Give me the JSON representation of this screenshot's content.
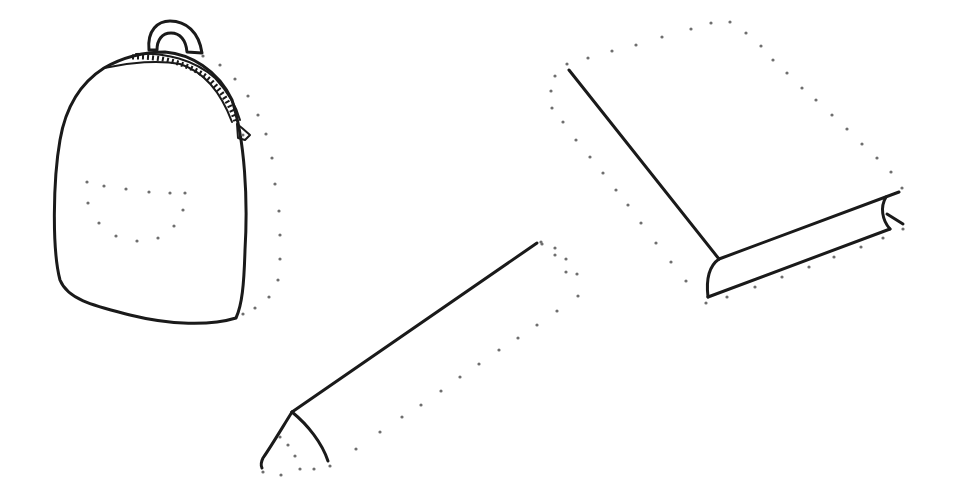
{
  "scene": {
    "description": "Complete-the-drawing worksheet: three partially drawn school objects with dotted guide lines",
    "background_color": "#ffffff",
    "ink_color": "#1a1a1a",
    "dot_color": "#6e6e6e",
    "objects": [
      {
        "name": "backpack",
        "state": "solid outline with dotted right side and dotted front pocket"
      },
      {
        "name": "pencil",
        "state": "solid top edge and tip, dotted body outline"
      },
      {
        "name": "book",
        "state": "solid left edge and spine, dotted cover outline"
      }
    ]
  }
}
